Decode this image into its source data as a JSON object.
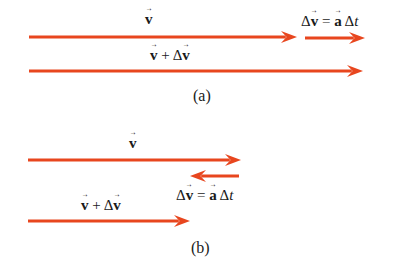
{
  "colors": {
    "arrow": "#e8461e",
    "text": "#1a1a1a",
    "background": "#ffffff"
  },
  "panel_a": {
    "caption": "(a)",
    "label_v": {
      "symbol": "v"
    },
    "label_dv": {
      "delta": "Δ",
      "v": "v",
      "eq": " = ",
      "a": "a",
      "dt": " Δ",
      "t": "t"
    },
    "label_sum": {
      "v": "v",
      "plus": " + Δ",
      "dv": "v"
    },
    "arrows": [
      {
        "name": "v",
        "x1": 29,
        "x2": 297,
        "y": 37
      },
      {
        "name": "delta-v",
        "x1": 305,
        "x2": 365,
        "y": 38
      },
      {
        "name": "v-plus-delta-v",
        "x1": 29,
        "x2": 363,
        "y": 71
      }
    ]
  },
  "panel_b": {
    "caption": "(b)",
    "label_v": {
      "symbol": "v"
    },
    "label_dv": {
      "delta": "Δ",
      "v": "v",
      "eq": " = ",
      "a": "a",
      "dt": " Δ",
      "t": "t"
    },
    "label_sum": {
      "v": "v",
      "plus": " + Δ",
      "dv": "v"
    },
    "arrows": [
      {
        "name": "v",
        "x1": 28,
        "x2": 241,
        "y": 160
      },
      {
        "name": "delta-v",
        "x1": 239,
        "x2": 190,
        "y": 176
      },
      {
        "name": "v-plus-delta-v",
        "x1": 28,
        "x2": 190,
        "y": 221
      }
    ]
  }
}
